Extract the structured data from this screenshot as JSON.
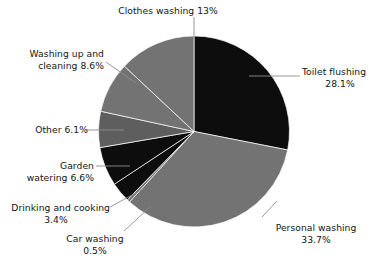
{
  "chart_data": {
    "type": "pie",
    "title": "",
    "legend_position": "callout-labels",
    "grid": false,
    "start_angle_deg": 0,
    "direction": "clockwise",
    "categories": [
      "Toilet flushing",
      "Personal washing",
      "Car washing",
      "Drinking and cooking",
      "Garden watering",
      "Other",
      "Washing up and cleaning",
      "Clothes washing"
    ],
    "values": [
      28.1,
      33.7,
      0.5,
      3.4,
      6.6,
      6.1,
      8.6,
      13
    ],
    "value_unit": "%",
    "slices": [
      {
        "label": "Toilet flushing",
        "value": 28.1,
        "value_text": "28.1%",
        "color": "#0d0d0d"
      },
      {
        "label": "Personal washing",
        "value": 33.7,
        "value_text": "33.7%",
        "color": "#737373"
      },
      {
        "label": "Car washing",
        "value": 0.5,
        "value_text": "0.5%",
        "color": "#737373"
      },
      {
        "label": "Drinking and cooking",
        "value": 3.4,
        "value_text": "3.4%",
        "color": "#0d0d0d"
      },
      {
        "label": "Garden watering",
        "value": 6.6,
        "value_text": "6.6%",
        "color": "#0d0d0d"
      },
      {
        "label": "Other",
        "value": 6.1,
        "value_text": "6.1%",
        "color": "#5e5e5e"
      },
      {
        "label": "Washing up and cleaning",
        "value": 8.6,
        "value_text": "8.6%",
        "color": "#737373"
      },
      {
        "label": "Clothes washing",
        "value": 13,
        "value_text": "13%",
        "color": "#737373"
      }
    ]
  },
  "labels": {
    "clothes": {
      "line1": "Clothes washing 13%",
      "line2": ""
    },
    "toilet": {
      "line1": "Toilet flushing",
      "line2": "28.1%"
    },
    "washup": {
      "line1": "Washing up and",
      "line2": "cleaning 8.6%"
    },
    "other": {
      "line1": "Other 6.1%",
      "line2": ""
    },
    "garden": {
      "line1": "Garden",
      "line2": "watering 6.6%"
    },
    "drinking": {
      "line1": "Drinking and cooking",
      "line2": "3.4%"
    },
    "car": {
      "line1": "Car washing",
      "line2": "0.5%"
    },
    "personal": {
      "line1": "Personal washing",
      "line2": "33.7%"
    }
  },
  "style": {
    "background": "#ffffff",
    "leader_line_color": "#8c8c8c",
    "text_color": "#141414",
    "slice_dark": "#0d0d0d",
    "slice_gray": "#737373",
    "slice_gray_mid": "#5e5e5e"
  }
}
